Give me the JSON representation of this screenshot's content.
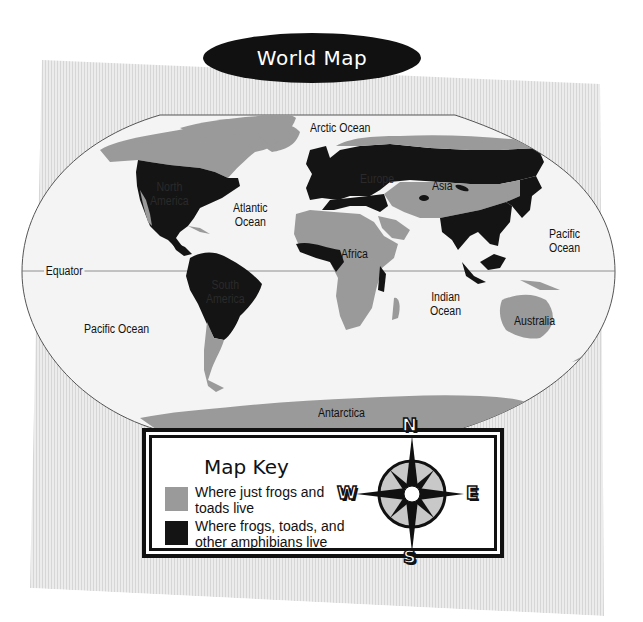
{
  "title": "World Map",
  "colors": {
    "frogs_toads_only": "#9a9a9a",
    "all_amphibians": "#141414",
    "ocean": "#f4f4f4",
    "background_stripes": "#e2e2e2",
    "title_pill": "#111111"
  },
  "map": {
    "equator_label": "Equator",
    "oceans": [
      {
        "id": "arctic",
        "label": "Arctic Ocean"
      },
      {
        "id": "atlantic",
        "label": "Atlantic Ocean",
        "lines": [
          "Atlantic",
          "Ocean"
        ]
      },
      {
        "id": "pacific_east",
        "label": "Pacific Ocean",
        "lines": [
          "Pacific",
          "Ocean"
        ]
      },
      {
        "id": "pacific_west",
        "label": "Pacific Ocean"
      },
      {
        "id": "indian",
        "label": "Indian Ocean",
        "lines": [
          "Indian",
          "Ocean"
        ]
      }
    ],
    "continents": [
      {
        "id": "north_america",
        "label": "North America",
        "lines": [
          "North",
          "America"
        ]
      },
      {
        "id": "south_america",
        "label": "South America",
        "lines": [
          "South",
          "America"
        ]
      },
      {
        "id": "europe",
        "label": "Europe"
      },
      {
        "id": "asia",
        "label": "Asia"
      },
      {
        "id": "africa",
        "label": "Africa"
      },
      {
        "id": "australia",
        "label": "Australia"
      },
      {
        "id": "antarctica",
        "label": "Antarctica"
      }
    ]
  },
  "legend": {
    "title": "Map Key",
    "items": [
      {
        "color": "#9a9a9a",
        "lines": [
          "Where just frogs and",
          "toads live"
        ]
      },
      {
        "color": "#141414",
        "lines": [
          "Where frogs, toads, and",
          "other amphibians live"
        ]
      }
    ]
  },
  "compass": {
    "north": "N",
    "south": "S",
    "east": "E",
    "west": "W"
  }
}
